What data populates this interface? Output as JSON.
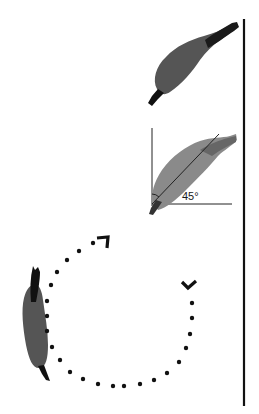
{
  "figure": {
    "angle_annotation": {
      "label": "45°",
      "value_degrees": 45
    },
    "rotation_path": {
      "style": "dotted",
      "direction_markers": [
        "start-arrow",
        "end-arrow"
      ],
      "dot_count": 23
    },
    "poses": [
      {
        "name": "upper-pose",
        "orientation_degrees": 40
      },
      {
        "name": "annotated-pose",
        "orientation_degrees": 45
      },
      {
        "name": "lower-pose",
        "orientation_degrees": 90
      }
    ],
    "colors": {
      "body": "#555555",
      "body_light": "#8a8a8a",
      "dark": "#111111",
      "line": "#1a1a1a"
    }
  }
}
